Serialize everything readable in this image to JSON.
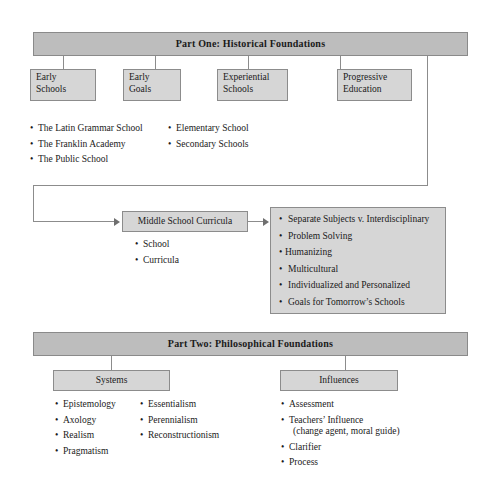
{
  "diagram": {
    "type": "hierarchy-outline",
    "part_one": {
      "header": "Part One: Historical Foundations",
      "nodes": [
        {
          "line1": "Early",
          "line2": "Schools"
        },
        {
          "line1": "Early",
          "line2": "Goals"
        },
        {
          "line1": "Experiential",
          "line2": "Schools"
        },
        {
          "line1": "Progressive",
          "line2": "Education"
        }
      ],
      "bullets_column_one": [
        "The Latin Grammar School",
        "The Franklin Academy",
        "The Public School"
      ],
      "bullets_column_two": [
        "Elementary School",
        "Secondary Schools"
      ]
    },
    "middle": {
      "node_label": "Middle School Curricula",
      "sub_bullets": [
        "School",
        "Curricula"
      ],
      "topics": [
        "Separate Subjects v. Interdisciplinary",
        "Problem Solving",
        "Humanizing",
        "Multicultural",
        "Individualized and Personalized",
        "Goals for Tomorrow’s Schools"
      ]
    },
    "part_two": {
      "header": "Part Two: Philosophical Foundations",
      "nodes": [
        {
          "label": "Systems"
        },
        {
          "label": "Influences"
        }
      ],
      "systems_column_one": [
        "Epistemology",
        "Axology",
        "Realism",
        "Pragmatism"
      ],
      "systems_column_two": [
        "Essentialism",
        "Perennialism",
        "Reconstructionism"
      ],
      "influences_bullets": [
        {
          "text": "Assessment"
        },
        {
          "text": "Teachers’ Influence",
          "continuation": "(change agent, moral guide)"
        },
        {
          "text": "Clarifier"
        },
        {
          "text": "Process"
        }
      ]
    },
    "colors": {
      "header_fill": "#bdbdbd",
      "box_fill": "#d6d6d6",
      "border": "#8c8c8c",
      "text": "#1a1a1a",
      "page_background": "#ffffff"
    }
  }
}
